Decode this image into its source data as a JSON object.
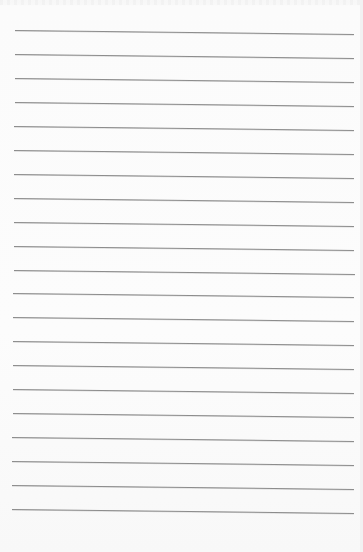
{
  "page": {
    "type": "lined-paper",
    "background_color": "#fbfbfb",
    "line_color": "#8c8c8c",
    "line_count": 21,
    "first_line_y": 30,
    "line_spacing": 23.95,
    "line_left_x_top": 15,
    "line_left_x_bottom": 12,
    "line_right_x": 354,
    "line_tilt_px": 4
  }
}
